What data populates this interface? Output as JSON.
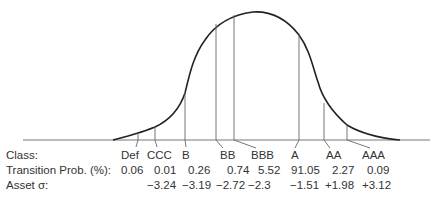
{
  "row_labels": {
    "class": "Class:",
    "transition_prob": "Transition Prob. (%):",
    "asset_sigma": "Asset σ:"
  },
  "classes": [
    {
      "name": "Def",
      "prob": "0.06",
      "sigma": ""
    },
    {
      "name": "CCC",
      "prob": "0.01",
      "sigma": "−3.24"
    },
    {
      "name": "B",
      "prob": "0.26",
      "sigma": "−3.19"
    },
    {
      "name": "BB",
      "prob": "0.74",
      "sigma": "−2.72"
    },
    {
      "name": "BBB",
      "prob": "5.52",
      "sigma": "−2.3"
    },
    {
      "name": "A",
      "prob": "91.05",
      "sigma": "−1.51"
    },
    {
      "name": "AA",
      "prob": "2.27",
      "sigma": "+1.98"
    },
    {
      "name": "AAA",
      "prob": "0.09",
      "sigma": "+3.12"
    }
  ],
  "colors": {
    "curve": "#222222",
    "lines": "#666666",
    "baseline": "#777777"
  }
}
